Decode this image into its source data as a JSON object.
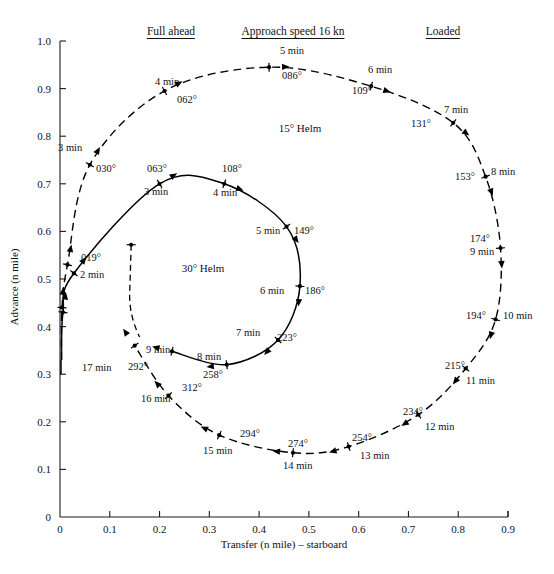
{
  "figure": {
    "title_headers": [
      {
        "id": "full-ahead",
        "text": "Full ahead",
        "x": 171,
        "y": 25
      },
      {
        "id": "approach-speed",
        "text": "Approach speed 16 kn",
        "x": 293,
        "y": 25
      },
      {
        "id": "loaded",
        "text": "Loaded",
        "x": 443,
        "y": 25
      }
    ],
    "helm_labels": [
      {
        "id": "helm-15",
        "text": "15° Helm",
        "x": 300,
        "y": 122
      },
      {
        "id": "helm-30",
        "text": "30° Helm",
        "x": 203,
        "y": 262
      }
    ]
  },
  "axes": {
    "x": {
      "label": "Transfer (n mile) – starboard",
      "min": 0,
      "max": 0.9,
      "ticks": [
        "0",
        "0.1",
        "0.2",
        "0.3",
        "0.4",
        "0.5",
        "0.6",
        "0.7",
        "0.8",
        "0.9"
      ],
      "tick_values": [
        0,
        0.1,
        0.2,
        0.3,
        0.4,
        0.5,
        0.6,
        0.7,
        0.8,
        0.9
      ],
      "px_min": 60,
      "px_max": 508
    },
    "y": {
      "label": "Advance (n mile)",
      "min": 0,
      "max": 1.0,
      "ticks": [
        "0",
        "0.1",
        "0.2",
        "0.3",
        "0.4",
        "0.5",
        "0.6",
        "0.7",
        "0.8",
        "0.9",
        "1.0"
      ],
      "tick_values": [
        0,
        0.1,
        0.2,
        0.3,
        0.4,
        0.5,
        0.6,
        0.7,
        0.8,
        0.9,
        1.0
      ],
      "px_min": 517,
      "px_max": 41
    }
  },
  "chart_data": {
    "type": "line",
    "xlabel": "Transfer (n mile) – starboard",
    "ylabel": "Advance (n mile)",
    "xlim": [
      0,
      0.9
    ],
    "ylim": [
      0,
      1.0
    ],
    "grid": false,
    "legend": "none",
    "series": [
      {
        "name": "15° Helm",
        "style": "dashed",
        "points": [
          {
            "t_min": 0,
            "heading": "000°",
            "x": 0.003,
            "y": 0.33
          },
          {
            "t_min": 1,
            "heading": null,
            "x": 0.004,
            "y": 0.44
          },
          {
            "t_min": 2,
            "heading": null,
            "x": 0.015,
            "y": 0.53
          },
          {
            "t_min": 3,
            "heading": "030°",
            "x": 0.06,
            "y": 0.74
          },
          {
            "t_min": 4,
            "heading": "062°",
            "x": 0.21,
            "y": 0.895
          },
          {
            "t_min": 5,
            "heading": "086°",
            "x": 0.42,
            "y": 0.945
          },
          {
            "t_min": 6,
            "heading": "109°",
            "x": 0.625,
            "y": 0.905
          },
          {
            "t_min": 7,
            "heading": "131°",
            "x": 0.79,
            "y": 0.828
          },
          {
            "t_min": 8,
            "heading": "153°",
            "x": 0.855,
            "y": 0.715
          },
          {
            "t_min": 9,
            "heading": "174°",
            "x": 0.885,
            "y": 0.565
          },
          {
            "t_min": 10,
            "heading": "194°",
            "x": 0.875,
            "y": 0.415
          },
          {
            "t_min": 11,
            "heading": "215°",
            "x": 0.815,
            "y": 0.312
          },
          {
            "t_min": 12,
            "heading": "234°",
            "x": 0.72,
            "y": 0.215
          },
          {
            "t_min": 13,
            "heading": "254°",
            "x": 0.58,
            "y": 0.148
          },
          {
            "t_min": 14,
            "heading": "274°",
            "x": 0.468,
            "y": 0.135
          },
          {
            "t_min": 15,
            "heading": "294°",
            "x": 0.32,
            "y": 0.172
          },
          {
            "t_min": 16,
            "heading": "312°",
            "x": 0.218,
            "y": 0.255
          },
          {
            "t_min": 17,
            "heading": "292°",
            "x": 0.15,
            "y": 0.36
          }
        ]
      },
      {
        "name": "30° Helm",
        "style": "solid",
        "points": [
          {
            "t_min": 0,
            "heading": "000°",
            "x": 0.003,
            "y": 0.33
          },
          {
            "t_min": 1,
            "heading": null,
            "x": 0.006,
            "y": 0.43
          },
          {
            "t_min": 2,
            "heading": "019°",
            "x": 0.028,
            "y": 0.512
          },
          {
            "t_min": 3,
            "heading": "063°",
            "x": 0.2,
            "y": 0.7
          },
          {
            "t_min": 4,
            "heading": "108°",
            "x": 0.33,
            "y": 0.7
          },
          {
            "t_min": 5,
            "heading": "149°",
            "x": 0.455,
            "y": 0.61
          },
          {
            "t_min": 6,
            "heading": "186°",
            "x": 0.482,
            "y": 0.485
          },
          {
            "t_min": 7,
            "heading": "223°",
            "x": 0.438,
            "y": 0.372
          },
          {
            "t_min": 8,
            "heading": "258°",
            "x": 0.335,
            "y": 0.32
          },
          {
            "t_min": 9,
            "heading": "292°",
            "x": 0.225,
            "y": 0.348
          }
        ]
      }
    ],
    "annotations": [
      {
        "text": "Full ahead",
        "underlined": true
      },
      {
        "text": "Approach speed 16 kn",
        "underlined": true
      },
      {
        "text": "Loaded",
        "underlined": true
      },
      {
        "text": "15° Helm"
      },
      {
        "text": "30° Helm"
      }
    ]
  },
  "callouts": [
    {
      "id": "c-3min-dash",
      "text": "3 min",
      "x": 58,
      "y": 142,
      "align": "left"
    },
    {
      "id": "c-030",
      "text": "030°",
      "x": 96,
      "y": 163,
      "align": "left"
    },
    {
      "id": "c-4min-dash",
      "text": "4 min",
      "x": 155,
      "y": 76,
      "align": "left"
    },
    {
      "id": "c-062",
      "text": "062°",
      "x": 177,
      "y": 94,
      "align": "left"
    },
    {
      "id": "c-5min-dash",
      "text": "5 min",
      "x": 292,
      "y": 45,
      "align": "center"
    },
    {
      "id": "c-086",
      "text": "086°",
      "x": 292,
      "y": 70,
      "align": "center"
    },
    {
      "id": "c-6min-dash",
      "text": "6 min",
      "x": 368,
      "y": 64,
      "align": "left"
    },
    {
      "id": "c-109",
      "text": "109°",
      "x": 352,
      "y": 85,
      "align": "left"
    },
    {
      "id": "c-7min-dash",
      "text": "7 min",
      "x": 444,
      "y": 104,
      "align": "left"
    },
    {
      "id": "c-131",
      "text": "131°",
      "x": 411,
      "y": 118,
      "align": "left"
    },
    {
      "id": "c-8min-dash",
      "text": "8 min",
      "x": 491,
      "y": 166,
      "align": "left"
    },
    {
      "id": "c-153",
      "text": "153°",
      "x": 455,
      "y": 171,
      "align": "left"
    },
    {
      "id": "c-174",
      "text": "174°",
      "x": 470,
      "y": 233,
      "align": "left"
    },
    {
      "id": "c-9min-dash",
      "text": "9 min",
      "x": 470,
      "y": 246,
      "align": "left"
    },
    {
      "id": "c-10min-dash",
      "text": "10 min",
      "x": 503,
      "y": 310,
      "align": "left"
    },
    {
      "id": "c-194",
      "text": "194°",
      "x": 466,
      "y": 310,
      "align": "left"
    },
    {
      "id": "c-215",
      "text": "215°",
      "x": 445,
      "y": 360,
      "align": "left"
    },
    {
      "id": "c-11min-dash",
      "text": "11 min",
      "x": 466,
      "y": 375,
      "align": "left"
    },
    {
      "id": "c-234",
      "text": "234°",
      "x": 403,
      "y": 406,
      "align": "left"
    },
    {
      "id": "c-12min-dash",
      "text": "12 min",
      "x": 425,
      "y": 421,
      "align": "left"
    },
    {
      "id": "c-254",
      "text": "254°",
      "x": 352,
      "y": 432,
      "align": "left"
    },
    {
      "id": "c-13min-dash",
      "text": "13 min",
      "x": 360,
      "y": 450,
      "align": "left"
    },
    {
      "id": "c-274",
      "text": "274°",
      "x": 288,
      "y": 438,
      "align": "left"
    },
    {
      "id": "c-14min-dash",
      "text": "14 min",
      "x": 283,
      "y": 460,
      "align": "left"
    },
    {
      "id": "c-294",
      "text": "294°",
      "x": 240,
      "y": 428,
      "align": "left"
    },
    {
      "id": "c-15min-dash",
      "text": "15 min",
      "x": 203,
      "y": 445,
      "align": "left"
    },
    {
      "id": "c-312",
      "text": "312°",
      "x": 182,
      "y": 382,
      "align": "left"
    },
    {
      "id": "c-16min-dash",
      "text": "16 min",
      "x": 141,
      "y": 393,
      "align": "left"
    },
    {
      "id": "c-17min-dash",
      "text": "17 min",
      "x": 82,
      "y": 362,
      "align": "left"
    },
    {
      "id": "c-292-dash",
      "text": "292°",
      "x": 128,
      "y": 361,
      "align": "left"
    },
    {
      "id": "c-019",
      "text": "019°",
      "x": 81,
      "y": 252,
      "align": "left"
    },
    {
      "id": "c-2min-sol",
      "text": "2 min",
      "x": 80,
      "y": 269,
      "align": "left"
    },
    {
      "id": "c-063",
      "text": "063°",
      "x": 147,
      "y": 163,
      "align": "left"
    },
    {
      "id": "c-3min-sol",
      "text": "3 min",
      "x": 144,
      "y": 186,
      "align": "left"
    },
    {
      "id": "c-108",
      "text": "108°",
      "x": 222,
      "y": 163,
      "align": "left"
    },
    {
      "id": "c-4min-sol",
      "text": "4 min",
      "x": 213,
      "y": 187,
      "align": "left"
    },
    {
      "id": "c-149",
      "text": "149°",
      "x": 294,
      "y": 225,
      "align": "left"
    },
    {
      "id": "c-5min-sol",
      "text": "5 min",
      "x": 256,
      "y": 225,
      "align": "left"
    },
    {
      "id": "c-186",
      "text": "186°",
      "x": 305,
      "y": 285,
      "align": "left"
    },
    {
      "id": "c-6min-sol",
      "text": "6 min",
      "x": 260,
      "y": 285,
      "align": "left"
    },
    {
      "id": "c-223",
      "text": "223°",
      "x": 277,
      "y": 332,
      "align": "left"
    },
    {
      "id": "c-7min-sol",
      "text": "7 min",
      "x": 236,
      "y": 327,
      "align": "left"
    },
    {
      "id": "c-258",
      "text": "258°",
      "x": 203,
      "y": 369,
      "align": "left"
    },
    {
      "id": "c-8min-sol",
      "text": "8 min",
      "x": 197,
      "y": 351,
      "align": "left"
    },
    {
      "id": "c-9min-sol",
      "text": "9 min",
      "x": 146,
      "y": 344,
      "align": "left"
    }
  ]
}
